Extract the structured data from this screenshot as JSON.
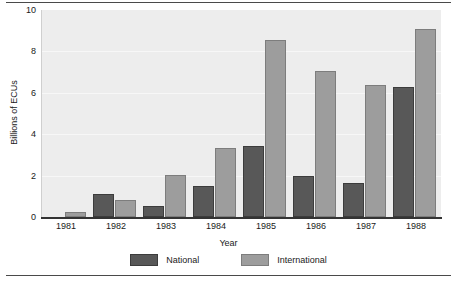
{
  "chart_data": {
    "type": "bar",
    "title": "",
    "xlabel": "Year",
    "ylabel": "Billions of ECUs",
    "categories": [
      "1981",
      "1982",
      "1983",
      "1984",
      "1985",
      "1986",
      "1987",
      "1988"
    ],
    "series": [
      {
        "name": "National",
        "color": "#585858",
        "values": [
          0,
          1.1,
          0.55,
          1.5,
          3.45,
          2.0,
          1.65,
          6.3
        ]
      },
      {
        "name": "International",
        "color": "#9d9d9d",
        "values": [
          0.25,
          0.8,
          2.05,
          3.35,
          8.55,
          7.05,
          6.4,
          9.1
        ]
      }
    ],
    "ylim": [
      0,
      10
    ],
    "yticks": [
      "0",
      "2",
      "4",
      "6",
      "8",
      "10"
    ],
    "grid": true,
    "legend_position": "bottom"
  },
  "figure": {
    "plot_background": "#ededed",
    "rule_color": "#4a4a4a"
  }
}
